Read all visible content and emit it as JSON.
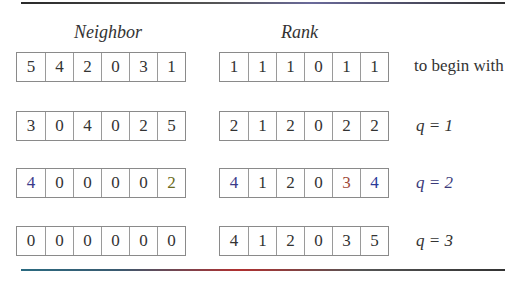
{
  "headings": {
    "neighbor": "Neighbor",
    "rank": "Rank"
  },
  "rows": [
    {
      "neighbor": [
        "5",
        "4",
        "2",
        "0",
        "3",
        "1"
      ],
      "rank": [
        "1",
        "1",
        "1",
        "0",
        "1",
        "1"
      ],
      "label": "to begin with"
    },
    {
      "neighbor": [
        "3",
        "0",
        "4",
        "0",
        "2",
        "5"
      ],
      "rank": [
        "2",
        "1",
        "2",
        "0",
        "2",
        "2"
      ],
      "label": "q = 1"
    },
    {
      "neighbor": [
        "4",
        "0",
        "0",
        "0",
        "0",
        "2"
      ],
      "rank": [
        "4",
        "1",
        "2",
        "0",
        "3",
        "4"
      ],
      "label": "q = 2"
    },
    {
      "neighbor": [
        "0",
        "0",
        "0",
        "0",
        "0",
        "0"
      ],
      "rank": [
        "4",
        "1",
        "2",
        "0",
        "3",
        "5"
      ],
      "label": "q = 3"
    }
  ],
  "colors": {
    "text": "#333333",
    "cell_border": "#8a8a8a",
    "rule": "#2a2a2a"
  }
}
